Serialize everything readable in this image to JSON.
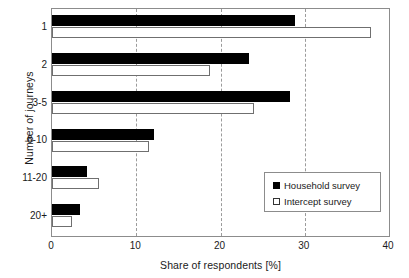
{
  "chart_data": {
    "type": "bar",
    "orientation": "horizontal",
    "title": "",
    "xlabel": "Share of respondents [%]",
    "ylabel": "Number of journeys",
    "categories": [
      "1",
      "2",
      "3-5",
      "6-10",
      "11-20",
      "20+"
    ],
    "series": [
      {
        "name": "Household survey",
        "values": [
          28.8,
          23.4,
          28.2,
          12.1,
          4.2,
          3.3
        ],
        "color": "#000000",
        "swatch": "filled"
      },
      {
        "name": "Intercept survey",
        "values": [
          37.9,
          18.7,
          24.0,
          11.5,
          5.6,
          2.4
        ],
        "color": "#ffffff",
        "swatch": "hollow"
      }
    ],
    "xlim": [
      0,
      40
    ],
    "xticks": [
      0,
      10,
      20,
      30,
      40
    ],
    "xtick_labels": [
      "0",
      "10",
      "20",
      "30",
      "40"
    ],
    "gridlines": [
      10,
      20,
      30
    ],
    "grid": "vertical-dashed",
    "legend_position": "lower-right-inside",
    "frame": true
  },
  "legend": {
    "entries": [
      {
        "label": "Household survey"
      },
      {
        "label": "Intercept survey"
      }
    ]
  },
  "colors": {
    "household": "#000000",
    "intercept": "#ffffff",
    "frame": "#8c8c8c",
    "grid": "#9b9b9b",
    "background": "#ffffff",
    "text": "#1a1a1a"
  }
}
